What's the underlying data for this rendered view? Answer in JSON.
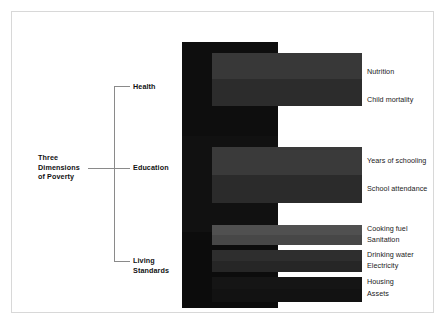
{
  "diagram": {
    "root": {
      "label": "Three\nDimensions\nof Poverty",
      "line1": "Three",
      "line2": "Dimensions",
      "line3": "of Poverty"
    },
    "dimensions": [
      {
        "id": "health",
        "label": "Health",
        "label_line1": "Health",
        "label_line2": "",
        "block_color": "#0e0e0e",
        "indicators": [
          {
            "label": "Nutrition",
            "color": "#383838"
          },
          {
            "label": "Child mortality",
            "color": "#2c2c2c"
          }
        ]
      },
      {
        "id": "education",
        "label": "Education",
        "label_line1": "Education",
        "label_line2": "",
        "block_color": "#111111",
        "indicators": [
          {
            "label": "Years of schooling",
            "color": "#3a3a3a"
          },
          {
            "label": "School attendance",
            "color": "#2b2b2b"
          }
        ]
      },
      {
        "id": "living-standards",
        "label": "Living Standards",
        "label_line1": "Living",
        "label_line2": "Standards",
        "block_color": "#0c0c0c",
        "indicators": [
          {
            "label": "Cooking fuel",
            "color": "#505050"
          },
          {
            "label": "Sanitation",
            "color": "#474747"
          },
          {
            "label": "Drinking water",
            "color": "#2e2e2e"
          },
          {
            "label": "Electricity",
            "color": "#262626"
          },
          {
            "label": "Housing",
            "color": "#151515"
          },
          {
            "label": "Assets",
            "color": "#121212"
          }
        ]
      }
    ],
    "colors": {
      "frame_border": "#d8d8d8",
      "connector_line": "#8a8a8a",
      "background": "#ffffff",
      "text": "#111111"
    }
  }
}
